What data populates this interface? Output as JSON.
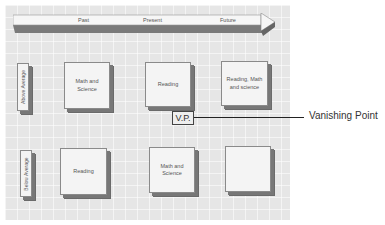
{
  "diagram": {
    "timeline": {
      "labels": [
        "Past",
        "Present",
        "Future"
      ]
    },
    "rows": [
      {
        "label": "Above Average",
        "boxes": [
          "Math and Science",
          "Reading",
          "Reading, Math and science"
        ]
      },
      {
        "label": "Below Average",
        "boxes": [
          "Reading",
          "Math and Science",
          ""
        ]
      }
    ],
    "vanishing_point": {
      "box_label": "V.P.",
      "callout": "Vanishing Point"
    },
    "colors": {
      "panel": "#e6e6e6",
      "box_face": "#f4f4f4",
      "box_shadow": "#777777"
    }
  }
}
